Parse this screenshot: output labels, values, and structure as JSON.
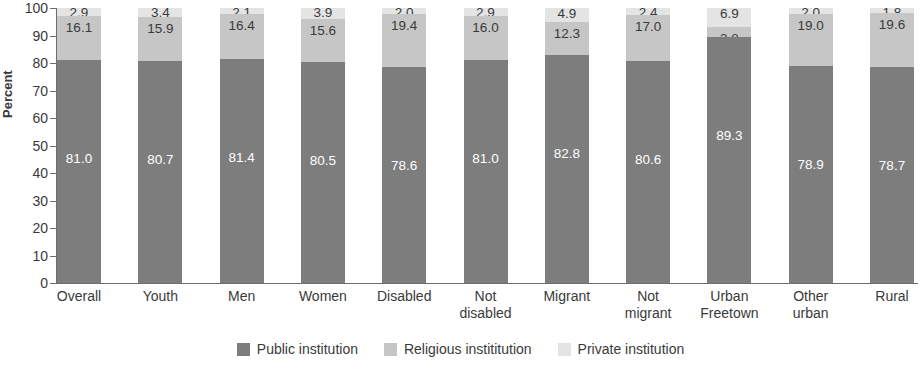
{
  "chart_data": {
    "type": "bar",
    "subtype": "stacked-bar",
    "title": "",
    "xlabel": "",
    "ylabel": "Percent",
    "ylim": [
      0,
      100
    ],
    "yticks": [
      0,
      10,
      20,
      30,
      40,
      50,
      60,
      70,
      80,
      90,
      100
    ],
    "ytick_labels": [
      "0",
      "10",
      "20",
      "30",
      "40",
      "50",
      "60",
      "70",
      "80",
      "90",
      "100"
    ],
    "grid": false,
    "legend_position": "bottom",
    "categories": [
      "Overall",
      "Youth",
      "Men",
      "Women",
      "Disabled",
      "Not disabled",
      "Migrant",
      "Not migrant",
      "Urban Freetown",
      "Other urban",
      "Rural"
    ],
    "category_lines": [
      [
        "Overall"
      ],
      [
        "Youth"
      ],
      [
        "Men"
      ],
      [
        "Women"
      ],
      [
        "Disabled"
      ],
      [
        "Not",
        "disabled"
      ],
      [
        "Migrant"
      ],
      [
        "Not",
        "migrant"
      ],
      [
        "Urban",
        "Freetown"
      ],
      [
        "Other",
        "urban"
      ],
      [
        "Rural"
      ]
    ],
    "series": [
      {
        "name": "Public institution",
        "color": "#7d7d7d",
        "values": [
          81.0,
          80.7,
          81.4,
          80.5,
          78.6,
          81.0,
          82.8,
          80.6,
          89.3,
          78.9,
          78.7
        ],
        "labels": [
          "81.0",
          "80.7",
          "81.4",
          "80.5",
          "78.6",
          "81.0",
          "82.8",
          "80.6",
          "89.3",
          "78.9",
          "78.7"
        ]
      },
      {
        "name": "Religious instititution",
        "color": "#c6c6c6",
        "values": [
          16.1,
          15.9,
          16.4,
          15.6,
          19.4,
          16.0,
          12.3,
          17.0,
          3.8,
          19.0,
          19.6
        ],
        "labels": [
          "16.1",
          "15.9",
          "16.4",
          "15.6",
          "19.4",
          "16.0",
          "12.3",
          "17.0",
          "3.8",
          "19.0",
          "19.6"
        ]
      },
      {
        "name": "Private institution",
        "color": "#e4e4e4",
        "values": [
          2.9,
          3.4,
          2.1,
          3.9,
          2.0,
          2.9,
          4.9,
          2.4,
          6.9,
          2.0,
          1.8
        ],
        "labels": [
          "2.9",
          "3.4",
          "2.1",
          "3.9",
          "2.0",
          "2.9",
          "4.9",
          "2.4",
          "6.9",
          "2.0",
          "1.8"
        ]
      }
    ]
  },
  "legend": {
    "items": [
      {
        "label": "Public institution",
        "color": "#7d7d7d"
      },
      {
        "label": "Religious instititution",
        "color": "#c6c6c6"
      },
      {
        "label": "Private institution",
        "color": "#e4e4e4"
      }
    ]
  },
  "axis": {
    "y_title": "Percent"
  }
}
